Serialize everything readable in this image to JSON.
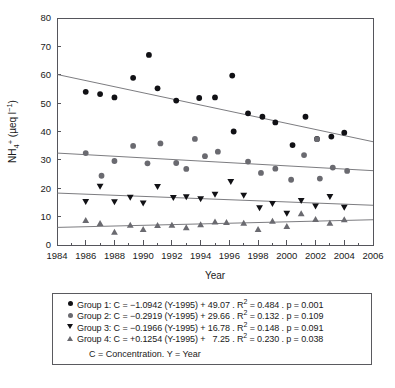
{
  "chart_data": {
    "type": "scatter",
    "title": "",
    "xlabel": "Year",
    "ylabel": "NH4+ (µeq l−1)",
    "xlim": [
      1984,
      2006
    ],
    "ylim": [
      0,
      80
    ],
    "xticks": [
      1984,
      1986,
      1988,
      1990,
      1992,
      1994,
      1996,
      1998,
      2000,
      2002,
      2004,
      2006
    ],
    "yticks": [
      0,
      10,
      20,
      30,
      40,
      50,
      60,
      70,
      80
    ],
    "grid": false,
    "legend_position": "below-plot",
    "series": [
      {
        "name": "Group 1",
        "marker": "filled-circle",
        "color": "#111115",
        "points": [
          [
            1986.0,
            54.0
          ],
          [
            1987.0,
            53.2
          ],
          [
            1988.0,
            52.0
          ],
          [
            1989.3,
            58.9
          ],
          [
            1990.4,
            67.0
          ],
          [
            1991.0,
            55.2
          ],
          [
            1992.3,
            50.9
          ],
          [
            1993.9,
            51.8
          ],
          [
            1995.0,
            52.0
          ],
          [
            1996.2,
            59.7
          ],
          [
            1996.3,
            40.0
          ],
          [
            1997.3,
            46.4
          ],
          [
            1998.3,
            45.2
          ],
          [
            1999.2,
            43.2
          ],
          [
            2000.4,
            35.2
          ],
          [
            2001.3,
            45.2
          ],
          [
            2002.1,
            37.4
          ],
          [
            2003.1,
            38.2
          ],
          [
            2004.0,
            39.6
          ]
        ],
        "trend": {
          "x1": 1984,
          "y1": 60.1,
          "x2": 2006,
          "y2": 36.4
        }
      },
      {
        "name": "Group 2",
        "marker": "filled-circle",
        "color": "#6a6a70",
        "points": [
          [
            1986.0,
            32.4
          ],
          [
            1987.1,
            24.4
          ],
          [
            1988.0,
            29.6
          ],
          [
            1989.3,
            34.9
          ],
          [
            1990.3,
            28.8
          ],
          [
            1991.2,
            35.8
          ],
          [
            1992.3,
            28.9
          ],
          [
            1993.0,
            26.8
          ],
          [
            1993.6,
            37.4
          ],
          [
            1994.3,
            31.3
          ],
          [
            1995.2,
            32.9
          ],
          [
            1997.3,
            29.4
          ],
          [
            1998.2,
            25.4
          ],
          [
            1999.2,
            26.9
          ],
          [
            2000.3,
            23.0
          ],
          [
            2001.2,
            31.7
          ],
          [
            2002.1,
            37.3
          ],
          [
            2002.3,
            23.4
          ],
          [
            2003.2,
            27.3
          ],
          [
            2004.2,
            26.1
          ]
        ],
        "trend": {
          "x1": 1984,
          "y1": 32.4,
          "x2": 2006,
          "y2": 26.2
        }
      },
      {
        "name": "Group 3",
        "marker": "filled-triangle-down",
        "color": "#111115",
        "points": [
          [
            1986.0,
            15.2
          ],
          [
            1987.0,
            20.6
          ],
          [
            1988.0,
            15.1
          ],
          [
            1989.1,
            16.7
          ],
          [
            1990.0,
            14.7
          ],
          [
            1991.0,
            20.5
          ],
          [
            1992.1,
            16.6
          ],
          [
            1993.0,
            16.9
          ],
          [
            1994.0,
            16.2
          ],
          [
            1995.0,
            17.8
          ],
          [
            1996.1,
            22.3
          ],
          [
            1997.0,
            17.4
          ],
          [
            1998.1,
            13.0
          ],
          [
            1999.0,
            14.5
          ],
          [
            2000.0,
            11.1
          ],
          [
            2001.0,
            15.6
          ],
          [
            2002.0,
            13.6
          ],
          [
            2003.0,
            17.0
          ],
          [
            2004.0,
            13.2
          ]
        ],
        "trend": {
          "x1": 1984,
          "y1": 18.3,
          "x2": 2006,
          "y2": 14.0
        }
      },
      {
        "name": "Group 4",
        "marker": "filled-triangle-up",
        "color": "#6a6a70",
        "points": [
          [
            1986.0,
            8.7
          ],
          [
            1987.0,
            7.7
          ],
          [
            1988.0,
            4.6
          ],
          [
            1989.1,
            7.1
          ],
          [
            1990.0,
            5.6
          ],
          [
            1991.0,
            7.0
          ],
          [
            1992.0,
            7.1
          ],
          [
            1993.0,
            6.2
          ],
          [
            1994.0,
            7.2
          ],
          [
            1995.0,
            8.2
          ],
          [
            1995.8,
            8.0
          ],
          [
            1997.0,
            7.8
          ],
          [
            1998.0,
            5.6
          ],
          [
            1999.0,
            8.5
          ],
          [
            2000.0,
            6.6
          ],
          [
            2001.0,
            11.1
          ],
          [
            2002.0,
            9.1
          ],
          [
            2003.0,
            7.8
          ],
          [
            2004.0,
            9.0
          ]
        ],
        "trend": {
          "x1": 1984,
          "y1": 6.2,
          "x2": 2006,
          "y2": 8.9
        }
      }
    ]
  },
  "axis": {
    "y_label_main": "NH",
    "y_label_sub": "4",
    "y_label_sup": "+",
    "y_label_unit": " (µeq l",
    "y_label_unit_sup": "−1",
    "y_label_unit_end": ")",
    "x_title": "Year"
  },
  "legend": {
    "rows": [
      {
        "marker": "filled-circle-dark",
        "label": "Group 1: C = −1.0942 (Y-1995) + 49.07 . R",
        "r2_sup": "2",
        "tail": " = 0.484 . p = 0.001"
      },
      {
        "marker": "filled-circle-gray",
        "label": "Group 2: C = −0.2919 (Y-1995) + 29.66 . R",
        "r2_sup": "2",
        "tail": " = 0.132 . p = 0.109"
      },
      {
        "marker": "filled-triangle-down",
        "label": "Group 3: C = −0.1966 (Y-1995) + 16.78 . R",
        "r2_sup": "2",
        "tail": " = 0.148 . p = 0.091"
      },
      {
        "marker": "filled-triangle-up",
        "label": "Group 4: C = +0.1254 (Y-1995) +   7.25 . R",
        "r2_sup": "2",
        "tail": " = 0.230 . p = 0.038"
      }
    ],
    "note": "C = Concentration. Y = Year"
  },
  "colors": {
    "dark_marker": "#111115",
    "gray_marker": "#6a6a70",
    "axis": "#55555b",
    "trend_line": "#6d6d72"
  }
}
